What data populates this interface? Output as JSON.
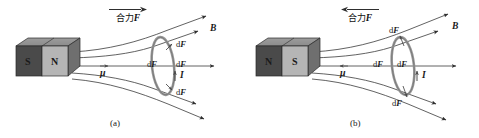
{
  "figure": {
    "type": "physics-diagram-pair",
    "background_color": "#ffffff",
    "line_color": "#3a3a3a",
    "ring_color": "#8a8a8a",
    "magnet_dark_color": "#4a4a4a",
    "magnet_light_color": "#b5b5b5"
  },
  "panels": [
    {
      "id": "a",
      "caption": "(a)",
      "resultant_force": {
        "label": "合力",
        "symbol": "F",
        "arrow_direction": "right"
      },
      "magnet": {
        "left_pole": "S",
        "right_pole": "N"
      },
      "axis_label": "μ",
      "field_label": "B",
      "current_label": "I",
      "force_labels": [
        {
          "text": "dF",
          "position": "ring-top-right"
        },
        {
          "text": "dF",
          "position": "ring-center-left"
        },
        {
          "text": "dF",
          "position": "ring-center-right"
        },
        {
          "text": "dF",
          "position": "ring-bottom-right"
        }
      ]
    },
    {
      "id": "b",
      "caption": "(b)",
      "resultant_force": {
        "label": "合力",
        "symbol": "F",
        "arrow_direction": "left"
      },
      "magnet": {
        "left_pole": "N",
        "right_pole": "S"
      },
      "axis_label": "μ",
      "field_label": "B",
      "current_label": "I",
      "force_labels": [
        {
          "text": "dF",
          "position": "ring-above"
        },
        {
          "text": "dF",
          "position": "ring-center-left"
        },
        {
          "text": "dF",
          "position": "ring-center-right"
        },
        {
          "text": "dF",
          "position": "ring-below"
        }
      ]
    }
  ]
}
